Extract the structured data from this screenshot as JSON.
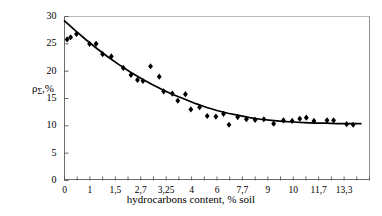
{
  "chart_data": {
    "type": "scatter",
    "title": "",
    "xlabel": "hydrocarbons content, %  soil",
    "ylabel": "ρΣ,%",
    "ylabel_base": "ρ",
    "ylabel_sub": "Σ",
    "ylabel_tail": ",%",
    "xlim": [
      0,
      14
    ],
    "ylim": [
      0,
      30
    ],
    "ygrid": false,
    "xgrid": false,
    "legend": "none",
    "ytick_labels": [
      "0",
      "5",
      "10",
      "15",
      "20",
      "25",
      "30"
    ],
    "ytick_values": [
      0,
      5,
      10,
      15,
      20,
      25,
      30
    ],
    "xtick_labels": [
      "0",
      "1",
      "1,5",
      "2,7",
      "3,25",
      "4",
      "6",
      "7,7",
      "9",
      "10",
      "11,7",
      "13,3"
    ],
    "xtick_values": [
      0,
      1,
      1.5,
      2.7,
      3.25,
      4,
      6,
      7.7,
      9,
      10,
      11.7,
      13.3
    ],
    "xtick_minor_count": 24,
    "marker": "diamond",
    "marker_color": "#000000",
    "line_color": "#000000",
    "points": [
      {
        "x": 0.12,
        "y": 25.8
      },
      {
        "x": 0.28,
        "y": 26.2
      },
      {
        "x": 0.55,
        "y": 26.8
      },
      {
        "x": 1.15,
        "y": 25.0
      },
      {
        "x": 1.45,
        "y": 25.0
      },
      {
        "x": 1.75,
        "y": 23.1
      },
      {
        "x": 2.15,
        "y": 22.7
      },
      {
        "x": 2.7,
        "y": 20.6
      },
      {
        "x": 3.05,
        "y": 19.3
      },
      {
        "x": 3.35,
        "y": 18.4
      },
      {
        "x": 3.6,
        "y": 18.2
      },
      {
        "x": 3.95,
        "y": 20.9
      },
      {
        "x": 4.35,
        "y": 19.0
      },
      {
        "x": 4.55,
        "y": 16.3
      },
      {
        "x": 4.95,
        "y": 15.9
      },
      {
        "x": 5.2,
        "y": 14.6
      },
      {
        "x": 5.55,
        "y": 15.8
      },
      {
        "x": 5.8,
        "y": 13.0
      },
      {
        "x": 6.2,
        "y": 13.4
      },
      {
        "x": 6.55,
        "y": 11.8
      },
      {
        "x": 6.95,
        "y": 11.7
      },
      {
        "x": 7.3,
        "y": 12.2
      },
      {
        "x": 7.55,
        "y": 10.2
      },
      {
        "x": 7.95,
        "y": 11.6
      },
      {
        "x": 8.35,
        "y": 11.2
      },
      {
        "x": 8.75,
        "y": 11.1
      },
      {
        "x": 9.15,
        "y": 11.2
      },
      {
        "x": 9.6,
        "y": 10.4
      },
      {
        "x": 10.05,
        "y": 11.0
      },
      {
        "x": 10.45,
        "y": 10.9
      },
      {
        "x": 10.8,
        "y": 11.3
      },
      {
        "x": 11.1,
        "y": 11.5
      },
      {
        "x": 11.45,
        "y": 10.9
      },
      {
        "x": 12.05,
        "y": 11.0
      },
      {
        "x": 12.35,
        "y": 11.0
      },
      {
        "x": 12.95,
        "y": 10.3
      },
      {
        "x": 13.25,
        "y": 10.2
      }
    ],
    "fit_curve": [
      {
        "x": 0.0,
        "y": 29.2
      },
      {
        "x": 0.5,
        "y": 27.4
      },
      {
        "x": 1.0,
        "y": 25.7
      },
      {
        "x": 1.5,
        "y": 24.1
      },
      {
        "x": 2.0,
        "y": 22.6
      },
      {
        "x": 2.5,
        "y": 21.2
      },
      {
        "x": 3.0,
        "y": 19.9
      },
      {
        "x": 3.5,
        "y": 18.7
      },
      {
        "x": 4.0,
        "y": 17.6
      },
      {
        "x": 4.5,
        "y": 16.6
      },
      {
        "x": 5.0,
        "y": 15.7
      },
      {
        "x": 5.5,
        "y": 14.9
      },
      {
        "x": 6.0,
        "y": 14.1
      },
      {
        "x": 6.5,
        "y": 13.4
      },
      {
        "x": 7.0,
        "y": 12.8
      },
      {
        "x": 7.5,
        "y": 12.3
      },
      {
        "x": 8.0,
        "y": 11.9
      },
      {
        "x": 8.5,
        "y": 11.5
      },
      {
        "x": 9.0,
        "y": 11.2
      },
      {
        "x": 9.5,
        "y": 11.0
      },
      {
        "x": 10.0,
        "y": 10.8
      },
      {
        "x": 10.5,
        "y": 10.7
      },
      {
        "x": 11.0,
        "y": 10.6
      },
      {
        "x": 11.5,
        "y": 10.5
      },
      {
        "x": 12.0,
        "y": 10.5
      },
      {
        "x": 12.5,
        "y": 10.4
      },
      {
        "x": 13.0,
        "y": 10.4
      },
      {
        "x": 13.6,
        "y": 10.4
      }
    ]
  }
}
